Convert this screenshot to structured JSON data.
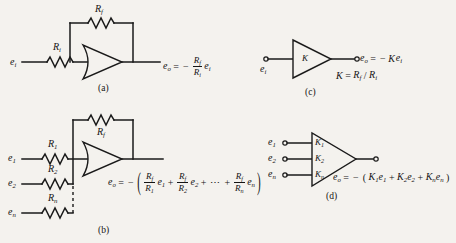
{
  "figure": {
    "background_color": "#f4f2ee",
    "ink_color": "#1a1a1a"
  },
  "panels": {
    "a": {
      "caption": "(a)",
      "input_source_label": "e",
      "input_source_sub": "i",
      "input_resistor_label": "R",
      "input_resistor_sub": "i",
      "feedback_resistor_label": "R",
      "feedback_resistor_sub": "f",
      "output_label": "e",
      "output_sub": "o",
      "equation": {
        "lhs": "e",
        "lhs_sub": "o",
        "equals": "=",
        "sign": "−",
        "numerator": "R",
        "numerator_sub": "f",
        "denominator": "R",
        "denominator_sub": "i",
        "trailing_var": "e",
        "trailing_sub": "i"
      }
    },
    "b": {
      "caption": "(b)",
      "feedback_resistor_label": "R",
      "feedback_resistor_sub": "f",
      "inputs": [
        {
          "source": "e",
          "source_sub": "1",
          "resistor": "R",
          "resistor_sub": "1"
        },
        {
          "source": "e",
          "source_sub": "2",
          "resistor": "R",
          "resistor_sub": "2"
        },
        {
          "source": "e",
          "source_sub": "n",
          "resistor": "R",
          "resistor_sub": "n"
        }
      ],
      "equation": {
        "lhs": "e",
        "lhs_sub": "o",
        "equals": "=",
        "sign": "−",
        "open_paren": "(",
        "close_paren": ")",
        "terms": [
          {
            "num": "R",
            "num_sub": "f",
            "den": "R",
            "den_sub": "1",
            "var": "e",
            "var_sub": "1",
            "op_after": "+"
          },
          {
            "num": "R",
            "num_sub": "f",
            "den": "R",
            "den_sub": "2",
            "var": "e",
            "var_sub": "2",
            "op_after": "+"
          },
          {
            "num": "R",
            "num_sub": "f",
            "den": "R",
            "den_sub": "n",
            "var": "e",
            "var_sub": "n",
            "op_after": ""
          }
        ],
        "ellipsis": "⋯",
        "ellipsis_op_after": "+"
      }
    },
    "c": {
      "caption": "(c)",
      "input_label": "e",
      "input_sub": "i",
      "gain_label": "K",
      "output_label": "e",
      "output_sub": "o",
      "equation_main": {
        "lhs": "e",
        "lhs_sub": "o",
        "equals": "=",
        "sign": "−",
        "gain": "K",
        "var": "e",
        "var_sub": "i"
      },
      "equation_gain": {
        "lhs": "K",
        "equals": "=",
        "numerator": "R",
        "numerator_sub": "f",
        "slash": "/",
        "denominator": "R",
        "denominator_sub": "i"
      }
    },
    "d": {
      "caption": "(d)",
      "inputs": [
        {
          "source": "e",
          "source_sub": "1",
          "gain": "K",
          "gain_sub": "1"
        },
        {
          "source": "e",
          "source_sub": "2",
          "gain": "K",
          "gain_sub": "2"
        },
        {
          "source": "e",
          "source_sub": "n",
          "gain": "K",
          "gain_sub": "n"
        }
      ],
      "output_label": "e",
      "output_sub": "o",
      "equation": {
        "lhs": "e",
        "lhs_sub": "o",
        "equals": "=",
        "sign": "−",
        "open_paren": "(",
        "close_paren": ")",
        "terms": [
          {
            "gain": "K",
            "gain_sub": "1",
            "var": "e",
            "var_sub": "1",
            "op_after": "+"
          },
          {
            "gain": "K",
            "gain_sub": "2",
            "var": "e",
            "var_sub": "2",
            "op_after": "+"
          },
          {
            "gain": "K",
            "gain_sub": "n",
            "var": "e",
            "var_sub": "n",
            "op_after": ""
          }
        ]
      }
    }
  }
}
